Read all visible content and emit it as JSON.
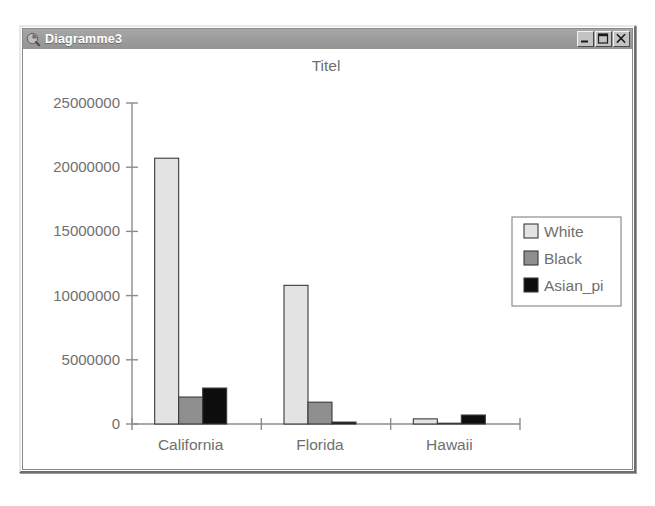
{
  "window": {
    "title": "Diagramme3",
    "icon": "chart-document-icon",
    "buttons": {
      "minimize": "minimize-button",
      "maximize": "maximize-button",
      "close": "close-button"
    }
  },
  "chart_data": {
    "type": "bar",
    "title": "Titel",
    "xlabel": "",
    "ylabel": "",
    "categories": [
      "California",
      "Florida",
      "Hawaii"
    ],
    "series": [
      {
        "name": "White",
        "color": "#e3e3e3",
        "values": [
          20700000,
          10800000,
          400000
        ]
      },
      {
        "name": "Black",
        "color": "#8f8f8f",
        "values": [
          2100000,
          1700000,
          20000
        ]
      },
      {
        "name": "Asian_pi",
        "color": "#0d0d0d",
        "values": [
          2800000,
          150000,
          700000
        ]
      }
    ],
    "ylim": [
      0,
      25000000
    ],
    "yticks": [
      0,
      5000000,
      10000000,
      15000000,
      20000000,
      25000000
    ],
    "ytick_labels": [
      "0",
      "5000000",
      "10000000",
      "15000000",
      "20000000",
      "25000000"
    ],
    "grid": false,
    "legend_position": "right"
  }
}
